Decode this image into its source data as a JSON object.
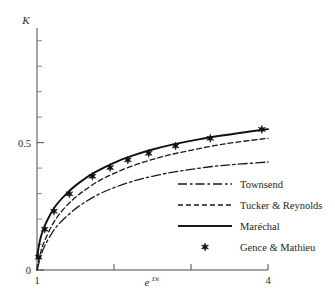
{
  "chart_data": {
    "type": "line",
    "title": "",
    "xlabel": "e^{Dt}",
    "xlabel_base": "e",
    "xlabel_exponent": "Dt",
    "ylabel": "K",
    "xlim": [
      1,
      4
    ],
    "ylim": [
      0,
      0.95
    ],
    "grid": false,
    "legend_position": "center-right",
    "x_ticks": [
      1,
      2,
      3,
      4
    ],
    "x_tick_labels": [
      "1",
      "",
      "",
      "4"
    ],
    "y_ticks": [
      0,
      0.5
    ],
    "y_tick_labels": [
      "0",
      "0.5"
    ],
    "y_minor_ticks": [
      0.1,
      0.2,
      0.3,
      0.4,
      0.6,
      0.7,
      0.8,
      0.9
    ],
    "series": [
      {
        "name": "Townsend",
        "style": "dashdot",
        "color": "#1a1a1a",
        "x": [
          1.0,
          1.05,
          1.1,
          1.2,
          1.3,
          1.45,
          1.6,
          1.8,
          2.0,
          2.25,
          2.5,
          2.75,
          3.0,
          3.3,
          3.6,
          4.0
        ],
        "y": [
          0.0,
          0.055,
          0.095,
          0.148,
          0.186,
          0.228,
          0.262,
          0.297,
          0.323,
          0.349,
          0.368,
          0.383,
          0.395,
          0.407,
          0.415,
          0.424
        ]
      },
      {
        "name": "Tucker & Reynolds",
        "style": "dashed",
        "color": "#1a1a1a",
        "x": [
          1.0,
          1.05,
          1.1,
          1.2,
          1.3,
          1.45,
          1.6,
          1.8,
          2.0,
          2.25,
          2.5,
          2.75,
          3.0,
          3.3,
          3.6,
          4.0
        ],
        "y": [
          0.0,
          0.072,
          0.115,
          0.178,
          0.223,
          0.272,
          0.309,
          0.349,
          0.379,
          0.41,
          0.434,
          0.454,
          0.47,
          0.488,
          0.502,
          0.517
        ]
      },
      {
        "name": "Maréchal",
        "style": "solid",
        "color": "#111111",
        "x": [
          1.0,
          1.04,
          1.08,
          1.15,
          1.25,
          1.4,
          1.55,
          1.75,
          2.0,
          2.25,
          2.5,
          2.8,
          3.1,
          3.4,
          3.7,
          4.0
        ],
        "y": [
          0.052,
          0.118,
          0.158,
          0.205,
          0.255,
          0.305,
          0.343,
          0.383,
          0.421,
          0.45,
          0.473,
          0.495,
          0.513,
          0.528,
          0.541,
          0.553
        ]
      }
    ],
    "markers": {
      "name": "Gence & Mathieu",
      "symbol": "six-pointed-star",
      "color": "#111111",
      "points": [
        {
          "x": 1.02,
          "y": 0.05
        },
        {
          "x": 1.1,
          "y": 0.16
        },
        {
          "x": 1.22,
          "y": 0.231
        },
        {
          "x": 1.42,
          "y": 0.299
        },
        {
          "x": 1.72,
          "y": 0.368
        },
        {
          "x": 1.95,
          "y": 0.402
        },
        {
          "x": 2.18,
          "y": 0.432
        },
        {
          "x": 2.45,
          "y": 0.458
        },
        {
          "x": 2.8,
          "y": 0.487
        },
        {
          "x": 3.25,
          "y": 0.517
        },
        {
          "x": 3.92,
          "y": 0.552
        }
      ]
    }
  },
  "legend": {
    "items": [
      {
        "label": "Townsend",
        "style": "dashdot"
      },
      {
        "label": "Tucker & Reynolds",
        "style": "dashed"
      },
      {
        "label": "Maréchal",
        "style": "solid"
      },
      {
        "label": "Gence & Mathieu",
        "style": "marker"
      }
    ]
  }
}
